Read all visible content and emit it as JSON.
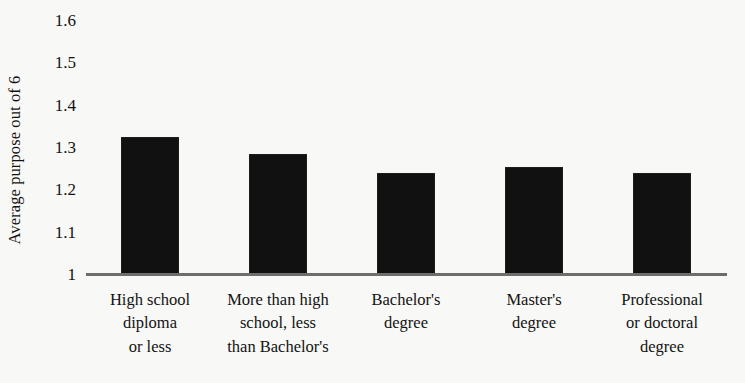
{
  "chart_data": {
    "type": "bar",
    "title": "",
    "subtitle": "",
    "xlabel": "",
    "ylabel": "Average purpose out of 6",
    "categories": [
      "High school diploma or less",
      "More than high school, less than Bachelor's",
      "Bachelor's degree",
      "Master's degree",
      "Professional or doctoral degree"
    ],
    "category_lines": [
      [
        "High school",
        "diploma",
        "or less"
      ],
      [
        "More than high",
        "school, less",
        "than Bachelor's"
      ],
      [
        "Bachelor's",
        "degree"
      ],
      [
        "Master's",
        "degree"
      ],
      [
        "Professional",
        "or doctoral",
        "degree"
      ]
    ],
    "values": [
      1.37,
      1.33,
      1.285,
      1.3,
      1.285
    ],
    "ylim": [
      1,
      1.6
    ],
    "yticks": [
      1.6,
      1.5,
      1.4,
      1.3,
      1.2,
      1.1,
      1
    ],
    "ytick_labels": [
      "1.6",
      "1.5",
      "1.4",
      "1.3",
      "1.2",
      "1.1",
      "1"
    ],
    "grid": false,
    "legend": false,
    "legend_position": "none",
    "bar_color": "#111111",
    "axis_color": "#6d6d6d",
    "background_color": "#f8f8f6"
  }
}
